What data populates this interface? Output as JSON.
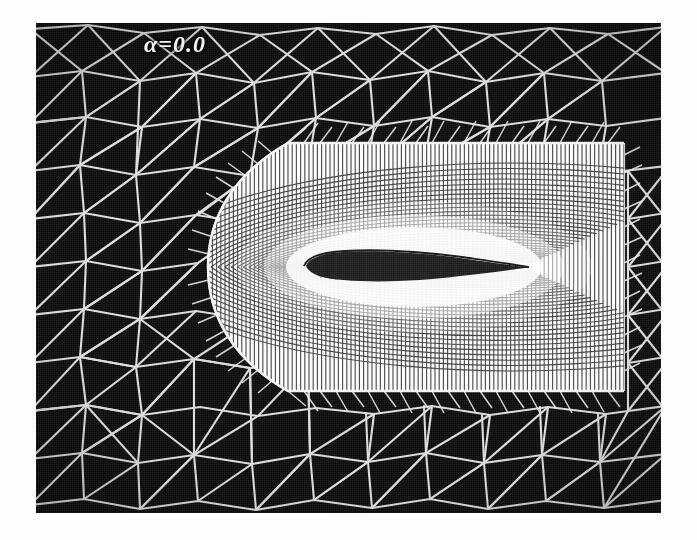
{
  "figure": {
    "kind": "cfd-mesh-plot",
    "annotation": "α=0.0",
    "background_color": "#0b0b0b",
    "line_color": "#f0f0f0",
    "panel": {
      "x": 36,
      "y": 23,
      "width": 625,
      "height": 490
    }
  },
  "chart_data": {
    "type": "mesh",
    "title": "",
    "subtitle": "",
    "xlabel": "",
    "ylabel": "",
    "annotations": [
      {
        "text": "α=0.0",
        "x": 0.18,
        "y": 0.07,
        "color": "#f0f0f0"
      }
    ],
    "legend_position": "none",
    "grid": false,
    "regions": [
      {
        "name": "far-field-unstructured",
        "element_type": "triangle",
        "description": "coarse unstructured triangular grid filling the outer domain",
        "approx_cell_size_px": 46,
        "fill_color": "#0b0b0b",
        "edge_color": "#e8e8e8"
      },
      {
        "name": "boundary-layer-structured",
        "element_type": "quadrilateral",
        "description": "C-type structured quad block wrapped around the airfoil; radial layers clustered toward the wall",
        "bounds_px": {
          "left": 186,
          "right": 588,
          "top": 120,
          "bottom": 368
        },
        "radial_layers": 34,
        "streamwise_cells": 150,
        "fill_color": "#f6f6f6",
        "edge_color": "#2a2a2a"
      },
      {
        "name": "airfoil-surface",
        "element_type": "solid",
        "description": "airfoil section, rounded leading edge at left, sharp trailing edge at right",
        "chord_px": 222,
        "leading_edge_px": {
          "x": 268,
          "y": 243
        },
        "trailing_edge_px": {
          "x": 492,
          "y": 245
        },
        "max_thickness_px": 22,
        "fill_color": "#1d1d1d"
      }
    ],
    "angle_of_attack_deg": 0.0
  }
}
